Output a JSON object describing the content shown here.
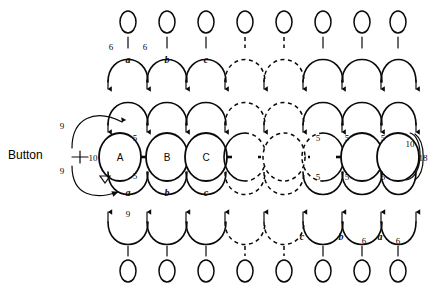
{
  "figure": {
    "background_color": "#ffffff",
    "ink_color": "#0a0a0a"
  },
  "button": {
    "label": "Button",
    "lead_label": "10",
    "feedback_top_label": "9",
    "feedback_bottom_label": "9"
  },
  "right_edge": {
    "inner_label": "10",
    "bracket_label": "18"
  },
  "nodes": {
    "labels": [
      "A",
      "B",
      "C",
      "",
      "",
      "",
      "",
      ""
    ],
    "dashed_flags": [
      false,
      false,
      false,
      false,
      true,
      true,
      false,
      false
    ],
    "count": 8
  },
  "node_weights": {
    "top_left": [
      "5",
      "",
      "",
      "",
      "",
      "5",
      "5",
      "5"
    ],
    "bottom_left": [
      "5",
      "",
      "",
      "",
      "",
      "5",
      "5",
      "5"
    ],
    "top_right": [
      "",
      "",
      "",
      "",
      "",
      "5",
      "",
      ""
    ],
    "bottom_right": [
      "",
      "",
      "",
      "",
      "",
      "5",
      "",
      ""
    ]
  },
  "top_arcs": {
    "labels": [
      "a",
      "b",
      "c",
      "",
      "",
      "",
      "",
      ""
    ],
    "edge_weights": [
      "6",
      "6"
    ],
    "dashed_indices": [
      3,
      4
    ]
  },
  "bottom_arcs": {
    "labels": [
      "a",
      "b",
      "c",
      "",
      "",
      "c",
      "b",
      "a"
    ],
    "edge_weights": [
      "6",
      "6"
    ],
    "weight_left": "9",
    "dashed_indices": [
      3,
      4
    ]
  },
  "ellipses": {
    "top_count": 8,
    "bottom_count": 8
  },
  "legend": {
    "dashed_meaning": "continuation",
    "arrow_meaning": "directed signal"
  }
}
